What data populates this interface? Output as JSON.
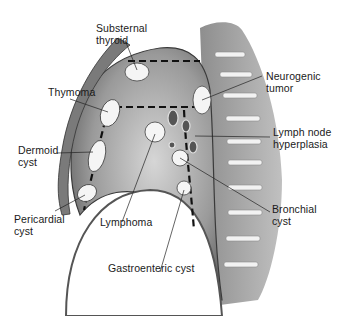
{
  "diagram": {
    "colors": {
      "background": "#ffffff",
      "tissue_dark": "#4a4a4a",
      "tissue_mid": "#8c8c8c",
      "tissue_light": "#c8c8c8",
      "mass_fill": "#f4f4f4",
      "dashed_line": "#111111",
      "text": "#1a1a1a"
    },
    "labels": [
      {
        "id": "substernal-thyroid",
        "text": "Substernal\nthyroid"
      },
      {
        "id": "thymoma",
        "text": "Thymoma"
      },
      {
        "id": "dermoid-cyst",
        "text": "Dermoid\ncyst"
      },
      {
        "id": "pericardial-cyst",
        "text": "Pericardial\ncyst"
      },
      {
        "id": "lymphoma",
        "text": "Lymphoma"
      },
      {
        "id": "gastroenteric-cyst",
        "text": "Gastroenteric cyst"
      },
      {
        "id": "neurogenic-tumor",
        "text": "Neurogenic\ntumor"
      },
      {
        "id": "lymph-node-hyperplasia",
        "text": "Lymph node\nhyperplasia"
      },
      {
        "id": "bronchial-cyst",
        "text": "Bronchial\ncyst"
      }
    ]
  }
}
